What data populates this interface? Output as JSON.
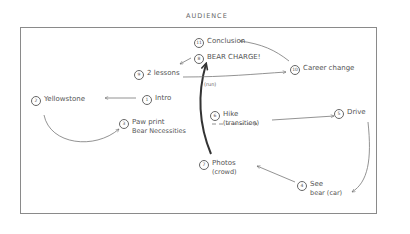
{
  "title": "AUDIENCE",
  "nodes": [
    {
      "id": "1",
      "num": "1",
      "label": "Intro",
      "sub": "",
      "x": 142,
      "y": 94
    },
    {
      "id": "2",
      "num": "2",
      "label": "Yellowstone",
      "sub": "",
      "x": 31,
      "y": 95
    },
    {
      "id": "3",
      "num": "3",
      "label": "Paw print",
      "sub": "Bear Necessities",
      "x": 119,
      "y": 118
    },
    {
      "id": "4",
      "num": "4",
      "label": "See",
      "sub": "bear (car)",
      "x": 297,
      "y": 180
    },
    {
      "id": "5",
      "num": "5",
      "label": "Drive",
      "sub": "",
      "x": 334,
      "y": 108
    },
    {
      "id": "6",
      "num": "6",
      "label": "Hike",
      "sub": "(transition)",
      "x": 210,
      "y": 110
    },
    {
      "id": "7",
      "num": "7",
      "label": "Photos",
      "sub": "(crowd)",
      "x": 199,
      "y": 159
    },
    {
      "id": "8",
      "num": "8",
      "label": "BEAR CHARGE!",
      "sub": "",
      "x": 194,
      "y": 53
    },
    {
      "id": "9",
      "num": "9",
      "label": "2 lessons",
      "sub": "",
      "x": 134,
      "y": 69
    },
    {
      "id": "10",
      "num": "10",
      "label": "Career change",
      "sub": "",
      "x": 290,
      "y": 64
    },
    {
      "id": "11",
      "num": "11",
      "label": "Conclusion",
      "sub": "",
      "x": 194,
      "y": 37
    }
  ],
  "annotations": [
    {
      "text": "(run)",
      "x": 204,
      "y": 81
    }
  ],
  "edges": [
    {
      "from": "1",
      "to": "2",
      "style": "solid",
      "path": "M136,98 L105,98"
    },
    {
      "from": "2",
      "to": "3",
      "style": "solid",
      "path": "M44,115 C50,145 95,150 119,129"
    },
    {
      "from": "6",
      "to": "5",
      "style": "solid",
      "path": "M272,120 L334,116"
    },
    {
      "from": "6-dash",
      "to": "6",
      "style": "dashed",
      "path": "M212,124 L257,124"
    },
    {
      "from": "5",
      "to": "4",
      "style": "solid",
      "path": "M368,122 C372,160 368,182 352,192"
    },
    {
      "from": "4",
      "to": "7",
      "style": "solid",
      "path": "M295,182 L257,166"
    },
    {
      "from": "7",
      "to": "8",
      "style": "bold",
      "path": "M211,154 C199,125 197,95 206,64"
    },
    {
      "from": "8",
      "to": "9",
      "style": "solid",
      "path": "M191,58 L180,64"
    },
    {
      "from": "9",
      "to": "10",
      "style": "solid",
      "path": "M183,77 C225,77 255,74 286,72"
    },
    {
      "from": "10",
      "to": "11",
      "style": "solid",
      "path": "M289,61 C275,50 262,44 240,41"
    }
  ]
}
